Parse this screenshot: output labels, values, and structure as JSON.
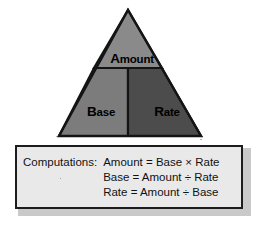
{
  "diagram": {
    "type": "percent-triangle",
    "title_text": "",
    "regions": [
      {
        "id": "amount",
        "label": "Amount",
        "initial": "A",
        "remainder": "mount",
        "fill": "#8a8a8a",
        "position": "top"
      },
      {
        "id": "base",
        "label": "Base",
        "initial": "B",
        "remainder": "ase",
        "fill": "#7c7c7c",
        "position": "bottom-left"
      },
      {
        "id": "rate",
        "label": "Rate",
        "initial": "R",
        "remainder": "ate",
        "fill": "#4c4c4c",
        "position": "bottom-right"
      }
    ],
    "outline_color": "#141414"
  },
  "computations": {
    "label": "Computations:",
    "lines": [
      "Amount = Base × Rate",
      "Base = Amount ÷ Rate",
      "Rate = Amount ÷ Base"
    ],
    "box_fill": "#e9e9e9",
    "box_border": "#1c1c1c",
    "shadow_color": "#c9c9c9"
  },
  "page": {
    "background": "#ffffff"
  }
}
